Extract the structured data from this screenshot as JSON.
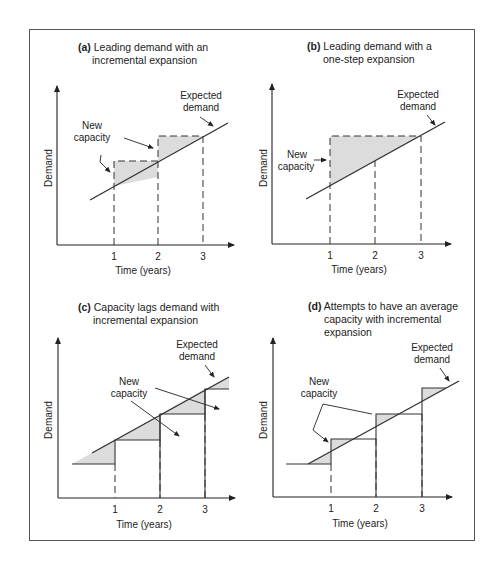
{
  "figure": {
    "panels": [
      {
        "id": "a",
        "tag": "(a)",
        "title_line1": "Leading demand with an",
        "title_line2": "incremental expansion",
        "new_capacity_label_1": "New",
        "new_capacity_label_2": "capacity",
        "expected_label_1": "Expected",
        "expected_label_2": "demand",
        "ylabel": "Demand",
        "xlabel": "Time (years)",
        "ticks": [
          "1",
          "2",
          "3"
        ]
      },
      {
        "id": "b",
        "tag": "(b)",
        "title_line1": "Leading demand with a",
        "title_line2": "one-step expansion",
        "new_capacity_label_1": "New",
        "new_capacity_label_2": "capacity",
        "expected_label_1": "Expected",
        "expected_label_2": "demand",
        "ylabel": "Demand",
        "xlabel": "Time (years)",
        "ticks": [
          "1",
          "2",
          "3"
        ]
      },
      {
        "id": "c",
        "tag": "(c)",
        "title_line1": "Capacity lags demand with",
        "title_line2": "incremental expansion",
        "new_capacity_label_1": "New",
        "new_capacity_label_2": "capacity",
        "expected_label_1": "Expected",
        "expected_label_2": "demand",
        "ylabel": "Demand",
        "xlabel": "Time (years)",
        "ticks": [
          "1",
          "2",
          "3"
        ]
      },
      {
        "id": "d",
        "tag": "(d)",
        "title_line1": "Attempts to have an average",
        "title_line2": "capacity with incremental",
        "title_line3": "expansion",
        "new_capacity_label_1": "New",
        "new_capacity_label_2": "capacity",
        "expected_label_1": "Expected",
        "expected_label_2": "demand",
        "ylabel": "Demand",
        "xlabel": "Time (years)",
        "ticks": [
          "1",
          "2",
          "3"
        ]
      }
    ],
    "colors": {
      "shade": "#dcdcdc",
      "line": "#333333",
      "frame": "#555555"
    }
  }
}
